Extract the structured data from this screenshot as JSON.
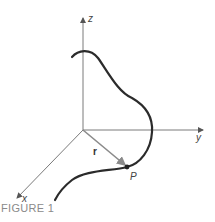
{
  "figure": {
    "caption": "FIGURE 1",
    "axes": {
      "z_label": "z",
      "y_label": "y",
      "x_label": "x"
    },
    "vector_label": "r",
    "point_label": "P",
    "colors": {
      "axis": "#7a7a7a",
      "curve": "#2b2b2b",
      "vector": "#8a8a8a",
      "caption": "#8a8a8a"
    }
  }
}
